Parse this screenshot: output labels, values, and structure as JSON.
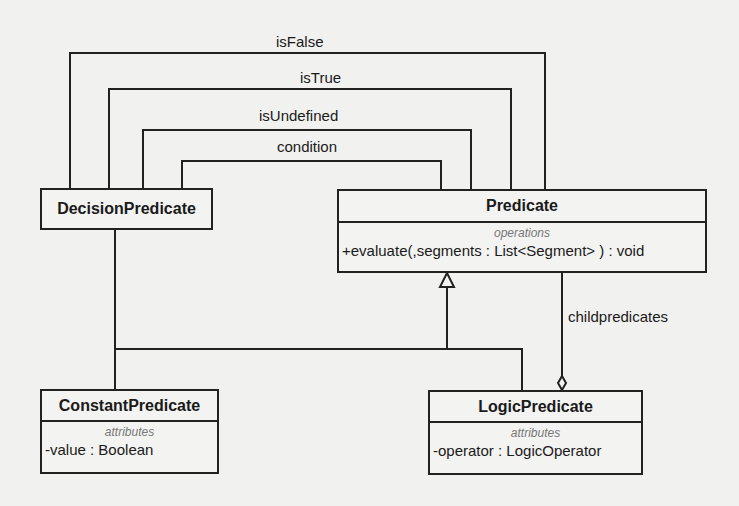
{
  "diagram": {
    "type": "UML class diagram",
    "classes": [
      {
        "id": "decision",
        "name": "DecisionPredicate"
      },
      {
        "id": "predicate",
        "name": "Predicate",
        "section_label": "operations",
        "members": [
          "+evaluate(,segments : List<Segment> ) : void"
        ]
      },
      {
        "id": "constant",
        "name": "ConstantPredicate",
        "section_label": "attributes",
        "members": [
          "-value : Boolean"
        ]
      },
      {
        "id": "logic",
        "name": "LogicPredicate",
        "section_label": "attributes",
        "members": [
          "-operator : LogicOperator"
        ]
      }
    ],
    "associations": [
      {
        "label": "isFalse",
        "from": "DecisionPredicate",
        "to": "Predicate"
      },
      {
        "label": "isTrue",
        "from": "DecisionPredicate",
        "to": "Predicate"
      },
      {
        "label": "isUndefined",
        "from": "DecisionPredicate",
        "to": "Predicate"
      },
      {
        "label": "condition",
        "from": "DecisionPredicate",
        "to": "Predicate"
      },
      {
        "label": "childpredicates",
        "from": "LogicPredicate",
        "to": "Predicate",
        "kind": "aggregation"
      }
    ],
    "generalizations": [
      {
        "child": "DecisionPredicate",
        "parent": "Predicate"
      },
      {
        "child": "ConstantPredicate",
        "parent": "Predicate"
      },
      {
        "child": "LogicPredicate",
        "parent": "Predicate"
      }
    ]
  },
  "colors": {
    "line": "#222222",
    "background": "#f1f1ef",
    "stereotype": "#777777"
  }
}
